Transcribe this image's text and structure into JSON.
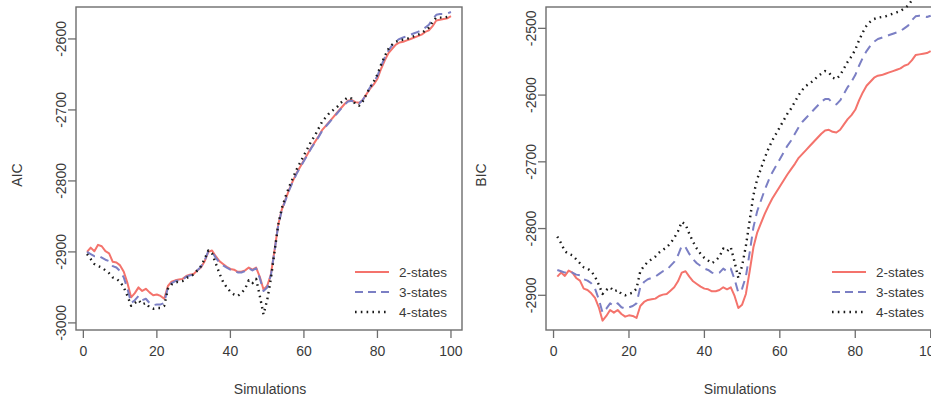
{
  "figure": {
    "panels": [
      "AIC panel",
      "BIC panel"
    ],
    "background": "#ffffff"
  },
  "colors": {
    "series_2states": "#f4736c",
    "series_3states": "#7b7fc4",
    "series_4states": "#1a1a1a",
    "axis": "#6d6d6d",
    "text": "#3a3a3a"
  },
  "legend": {
    "items": [
      {
        "label": "2-states",
        "style": "solid",
        "color": "#f4736c"
      },
      {
        "label": "3-states",
        "style": "dashed",
        "color": "#7b7fc4"
      },
      {
        "label": "4-states",
        "style": "dotted",
        "color": "#1a1a1a"
      }
    ]
  },
  "chart_data": [
    {
      "type": "line",
      "title": "",
      "xlabel": "Simulations",
      "ylabel": "AIC",
      "xlim": [
        -2,
        103
      ],
      "ylim": [
        -3010,
        -2555
      ],
      "xticks": [
        0,
        20,
        40,
        60,
        80,
        100
      ],
      "xticklabels": [
        "0",
        "20",
        "40",
        "60",
        "80",
        "100"
      ],
      "yticks": [
        -2600,
        -2700,
        -2800,
        -2900,
        -3000
      ],
      "yticklabels": [
        "-2600",
        "-2700",
        "-2800",
        "-2900",
        "-3000"
      ],
      "grid": false,
      "legend_position": "bottom-right",
      "x": [
        1,
        2,
        3,
        4,
        5,
        6,
        7,
        8,
        9,
        10,
        11,
        12,
        13,
        14,
        15,
        16,
        17,
        18,
        19,
        20,
        21,
        22,
        23,
        24,
        25,
        26,
        27,
        28,
        29,
        30,
        31,
        32,
        33,
        34,
        35,
        36,
        37,
        38,
        39,
        40,
        41,
        42,
        43,
        44,
        45,
        46,
        47,
        48,
        49,
        50,
        51,
        52,
        53,
        54,
        55,
        56,
        57,
        58,
        59,
        60,
        61,
        62,
        63,
        64,
        65,
        66,
        67,
        68,
        69,
        70,
        71,
        72,
        73,
        74,
        75,
        76,
        77,
        78,
        79,
        80,
        81,
        82,
        83,
        84,
        85,
        86,
        87,
        88,
        89,
        90,
        91,
        92,
        93,
        94,
        95,
        96,
        97,
        98,
        99,
        100
      ],
      "series": [
        {
          "name": "2-states",
          "style": "solid",
          "color": "#f4736c",
          "values": [
            -2900,
            -2894,
            -2899,
            -2890,
            -2892,
            -2899,
            -2902,
            -2914,
            -2915,
            -2919,
            -2928,
            -2944,
            -2964,
            -2958,
            -2950,
            -2955,
            -2952,
            -2957,
            -2961,
            -2960,
            -2962,
            -2966,
            -2948,
            -2942,
            -2940,
            -2939,
            -2938,
            -2934,
            -2932,
            -2931,
            -2926,
            -2922,
            -2913,
            -2900,
            -2898,
            -2906,
            -2913,
            -2917,
            -2921,
            -2924,
            -2925,
            -2928,
            -2928,
            -2926,
            -2922,
            -2925,
            -2922,
            -2935,
            -2953,
            -2948,
            -2932,
            -2898,
            -2862,
            -2840,
            -2826,
            -2812,
            -2800,
            -2789,
            -2780,
            -2771,
            -2762,
            -2753,
            -2745,
            -2737,
            -2728,
            -2722,
            -2716,
            -2710,
            -2704,
            -2698,
            -2692,
            -2687,
            -2686,
            -2689,
            -2690,
            -2686,
            -2678,
            -2670,
            -2664,
            -2656,
            -2642,
            -2630,
            -2620,
            -2614,
            -2608,
            -2605,
            -2604,
            -2602,
            -2600,
            -2598,
            -2596,
            -2594,
            -2590,
            -2588,
            -2582,
            -2574,
            -2573,
            -2572,
            -2571,
            -2568
          ]
        },
        {
          "name": "3-states",
          "style": "dashed",
          "color": "#7b7fc4",
          "values": [
            -2900,
            -2903,
            -2906,
            -2905,
            -2908,
            -2911,
            -2913,
            -2920,
            -2922,
            -2927,
            -2936,
            -2952,
            -2972,
            -2968,
            -2962,
            -2968,
            -2966,
            -2972,
            -2975,
            -2974,
            -2974,
            -2972,
            -2950,
            -2944,
            -2941,
            -2940,
            -2939,
            -2935,
            -2933,
            -2932,
            -2926,
            -2921,
            -2912,
            -2899,
            -2900,
            -2908,
            -2915,
            -2919,
            -2922,
            -2925,
            -2926,
            -2929,
            -2929,
            -2927,
            -2923,
            -2926,
            -2923,
            -2937,
            -2955,
            -2950,
            -2933,
            -2899,
            -2863,
            -2841,
            -2827,
            -2813,
            -2801,
            -2790,
            -2781,
            -2772,
            -2763,
            -2754,
            -2746,
            -2738,
            -2729,
            -2723,
            -2717,
            -2711,
            -2705,
            -2699,
            -2693,
            -2688,
            -2687,
            -2690,
            -2691,
            -2686,
            -2677,
            -2668,
            -2661,
            -2652,
            -2638,
            -2626,
            -2616,
            -2609,
            -2603,
            -2600,
            -2598,
            -2596,
            -2594,
            -2592,
            -2590,
            -2588,
            -2584,
            -2580,
            -2572,
            -2566,
            -2565,
            -2565,
            -2564,
            -2562
          ]
        },
        {
          "name": "4-states",
          "style": "dotted",
          "color": "#1a1a1a",
          "values": [
            -2903,
            -2910,
            -2917,
            -2920,
            -2922,
            -2926,
            -2930,
            -2936,
            -2938,
            -2942,
            -2950,
            -2962,
            -2976,
            -2972,
            -2968,
            -2974,
            -2972,
            -2978,
            -2980,
            -2979,
            -2979,
            -2976,
            -2952,
            -2946,
            -2943,
            -2942,
            -2941,
            -2937,
            -2934,
            -2932,
            -2926,
            -2920,
            -2910,
            -2898,
            -2902,
            -2916,
            -2930,
            -2942,
            -2950,
            -2956,
            -2960,
            -2962,
            -2958,
            -2952,
            -2940,
            -2944,
            -2938,
            -2962,
            -2988,
            -2968,
            -2938,
            -2900,
            -2862,
            -2838,
            -2822,
            -2808,
            -2796,
            -2784,
            -2774,
            -2764,
            -2754,
            -2744,
            -2736,
            -2726,
            -2716,
            -2710,
            -2704,
            -2700,
            -2696,
            -2690,
            -2686,
            -2682,
            -2684,
            -2692,
            -2694,
            -2688,
            -2678,
            -2668,
            -2660,
            -2650,
            -2636,
            -2624,
            -2614,
            -2608,
            -2604,
            -2602,
            -2601,
            -2600,
            -2598,
            -2596,
            -2594,
            -2592,
            -2588,
            -2584,
            -2576,
            -2570,
            -2570,
            -2570,
            -2569,
            -2567
          ]
        }
      ]
    },
    {
      "type": "line",
      "title": "",
      "xlabel": "Simulations",
      "ylabel": "BIC",
      "xlim": [
        -2,
        103
      ],
      "ylim": [
        -2952,
        -2468
      ],
      "xticks": [
        0,
        20,
        40,
        60,
        80,
        100
      ],
      "xticklabels": [
        "0",
        "20",
        "40",
        "60",
        "80",
        "100"
      ],
      "yticks": [
        -2500,
        -2600,
        -2700,
        -2800,
        -2900
      ],
      "yticklabels": [
        "-2500",
        "-2600",
        "-2700",
        "-2800",
        "-2900"
      ],
      "grid": false,
      "legend_position": "bottom-right",
      "x": [
        1,
        2,
        3,
        4,
        5,
        6,
        7,
        8,
        9,
        10,
        11,
        12,
        13,
        14,
        15,
        16,
        17,
        18,
        19,
        20,
        21,
        22,
        23,
        24,
        25,
        26,
        27,
        28,
        29,
        30,
        31,
        32,
        33,
        34,
        35,
        36,
        37,
        38,
        39,
        40,
        41,
        42,
        43,
        44,
        45,
        46,
        47,
        48,
        49,
        50,
        51,
        52,
        53,
        54,
        55,
        56,
        57,
        58,
        59,
        60,
        61,
        62,
        63,
        64,
        65,
        66,
        67,
        68,
        69,
        70,
        71,
        72,
        73,
        74,
        75,
        76,
        77,
        78,
        79,
        80,
        81,
        82,
        83,
        84,
        85,
        86,
        87,
        88,
        89,
        90,
        91,
        92,
        93,
        94,
        95,
        96,
        97,
        98,
        99,
        100
      ],
      "series": [
        {
          "name": "2-states",
          "style": "solid",
          "color": "#f4736c",
          "values": [
            -2872,
            -2866,
            -2871,
            -2863,
            -2866,
            -2874,
            -2878,
            -2890,
            -2892,
            -2897,
            -2904,
            -2918,
            -2938,
            -2931,
            -2922,
            -2926,
            -2922,
            -2928,
            -2932,
            -2930,
            -2931,
            -2934,
            -2916,
            -2910,
            -2907,
            -2906,
            -2905,
            -2901,
            -2899,
            -2898,
            -2893,
            -2888,
            -2879,
            -2866,
            -2864,
            -2872,
            -2879,
            -2883,
            -2887,
            -2890,
            -2891,
            -2894,
            -2894,
            -2892,
            -2888,
            -2891,
            -2888,
            -2901,
            -2919,
            -2914,
            -2898,
            -2864,
            -2828,
            -2806,
            -2792,
            -2778,
            -2766,
            -2755,
            -2746,
            -2737,
            -2728,
            -2719,
            -2711,
            -2703,
            -2694,
            -2688,
            -2682,
            -2676,
            -2670,
            -2664,
            -2658,
            -2653,
            -2652,
            -2655,
            -2656,
            -2652,
            -2644,
            -2636,
            -2630,
            -2622,
            -2608,
            -2596,
            -2586,
            -2580,
            -2574,
            -2571,
            -2570,
            -2568,
            -2566,
            -2564,
            -2562,
            -2560,
            -2556,
            -2554,
            -2548,
            -2540,
            -2539,
            -2538,
            -2537,
            -2534
          ]
        },
        {
          "name": "3-states",
          "style": "dashed",
          "color": "#7b7fc4",
          "values": [
            -2862,
            -2864,
            -2866,
            -2864,
            -2866,
            -2869,
            -2870,
            -2876,
            -2878,
            -2882,
            -2890,
            -2906,
            -2926,
            -2920,
            -2912,
            -2916,
            -2912,
            -2918,
            -2920,
            -2918,
            -2916,
            -2912,
            -2888,
            -2880,
            -2876,
            -2874,
            -2872,
            -2868,
            -2864,
            -2862,
            -2856,
            -2850,
            -2840,
            -2826,
            -2828,
            -2838,
            -2846,
            -2852,
            -2856,
            -2860,
            -2862,
            -2866,
            -2868,
            -2866,
            -2860,
            -2864,
            -2860,
            -2876,
            -2896,
            -2890,
            -2872,
            -2836,
            -2798,
            -2774,
            -2758,
            -2742,
            -2728,
            -2716,
            -2706,
            -2696,
            -2686,
            -2676,
            -2668,
            -2658,
            -2648,
            -2640,
            -2634,
            -2628,
            -2622,
            -2616,
            -2610,
            -2606,
            -2606,
            -2612,
            -2614,
            -2608,
            -2598,
            -2588,
            -2580,
            -2570,
            -2556,
            -2544,
            -2534,
            -2526,
            -2520,
            -2516,
            -2514,
            -2512,
            -2510,
            -2508,
            -2506,
            -2504,
            -2500,
            -2496,
            -2488,
            -2482,
            -2481,
            -2482,
            -2483,
            -2481
          ]
        },
        {
          "name": "4-states",
          "style": "dotted",
          "color": "#1a1a1a",
          "values": [
            -2812,
            -2822,
            -2834,
            -2838,
            -2840,
            -2846,
            -2852,
            -2858,
            -2860,
            -2864,
            -2872,
            -2884,
            -2898,
            -2892,
            -2888,
            -2894,
            -2892,
            -2898,
            -2900,
            -2898,
            -2896,
            -2890,
            -2864,
            -2856,
            -2850,
            -2846,
            -2842,
            -2836,
            -2832,
            -2828,
            -2822,
            -2814,
            -2804,
            -2790,
            -2794,
            -2808,
            -2820,
            -2830,
            -2838,
            -2844,
            -2848,
            -2852,
            -2848,
            -2842,
            -2830,
            -2834,
            -2828,
            -2850,
            -2874,
            -2856,
            -2826,
            -2788,
            -2750,
            -2726,
            -2710,
            -2694,
            -2680,
            -2668,
            -2658,
            -2648,
            -2638,
            -2628,
            -2620,
            -2610,
            -2600,
            -2592,
            -2586,
            -2582,
            -2578,
            -2572,
            -2568,
            -2564,
            -2566,
            -2574,
            -2576,
            -2570,
            -2560,
            -2550,
            -2542,
            -2532,
            -2518,
            -2506,
            -2496,
            -2490,
            -2486,
            -2484,
            -2483,
            -2482,
            -2480,
            -2478,
            -2476,
            -2474,
            -2470,
            -2466,
            -2458,
            -2452,
            -2452,
            -2452,
            -2451,
            -2449
          ]
        }
      ]
    }
  ]
}
